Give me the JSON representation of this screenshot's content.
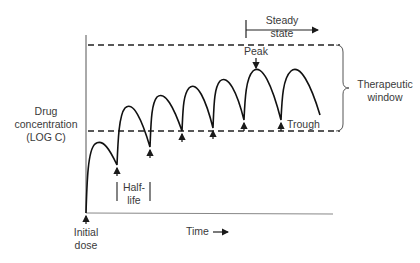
{
  "diagram": {
    "y_axis_label": [
      "Drug",
      "concentration",
      "(LOG C)"
    ],
    "x_axis_label": "Time",
    "initial_dose_label": [
      "Initial",
      "dose"
    ],
    "half_life_label": [
      "Half-",
      "life"
    ],
    "steady_state_label": [
      "Steady",
      "state"
    ],
    "peak_label": "Peak",
    "trough_label": "Trough",
    "therapeutic_window_label": [
      "Therapeutic",
      "window"
    ],
    "colors": {
      "line": "#1a1a1a",
      "text": "#3a3a3a",
      "background": "#ffffff"
    }
  }
}
